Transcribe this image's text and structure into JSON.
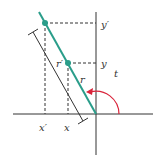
{
  "diagram": {
    "title": "",
    "labels": {
      "y_prime": "y′",
      "y": "y",
      "r": "r",
      "r_prime": "r′",
      "t": "t",
      "x_prime": "x′",
      "x": "x"
    },
    "colors": {
      "axis": "#333333",
      "ray": "#2a9d8a",
      "point": "#2a9d8a",
      "dashed": "#333333",
      "arc": "#d9233a",
      "dimension": "#333333"
    },
    "geometry": {
      "origin": [
        96,
        114
      ],
      "point_outer": [
        45,
        23
      ],
      "point_inner": [
        68,
        63
      ],
      "angle_arc_radius": 23
    }
  }
}
